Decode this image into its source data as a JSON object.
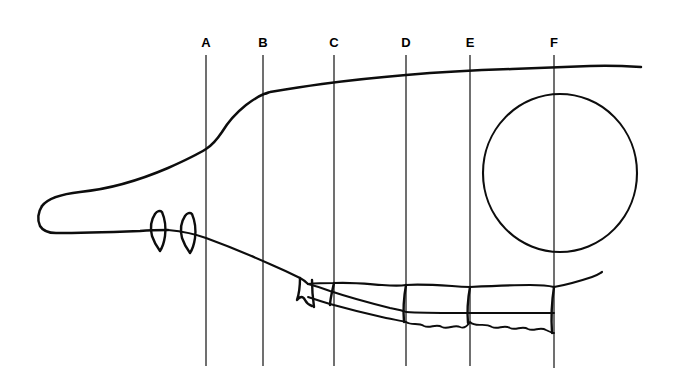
{
  "figure": {
    "background_color": "#ffffff",
    "ink_color": "#0d0d0d",
    "reference_line_color": "#1a1a1a",
    "width": 674,
    "height": 389
  },
  "reference_lines": [
    {
      "label": "A",
      "x": 206,
      "y_top": 55,
      "y_bottom": 366,
      "label_x": 206,
      "label_y": 36
    },
    {
      "label": "B",
      "x": 263,
      "y_top": 55,
      "y_bottom": 366,
      "label_x": 263,
      "label_y": 36
    },
    {
      "label": "C",
      "x": 334,
      "y_top": 55,
      "y_bottom": 366,
      "label_x": 334,
      "label_y": 36
    },
    {
      "label": "D",
      "x": 406,
      "y_top": 55,
      "y_bottom": 366,
      "label_x": 406,
      "label_y": 36
    },
    {
      "label": "E",
      "x": 470,
      "y_top": 55,
      "y_bottom": 366,
      "label_x": 470,
      "label_y": 36
    },
    {
      "label": "F",
      "x": 554,
      "y_top": 55,
      "y_bottom": 368,
      "label_x": 554,
      "label_y": 36
    }
  ],
  "strokes": {
    "dorsal_profile": "M 42 206 C 48 198 62 194 80 192 C 110 189 140 180 168 168 C 186 160 198 154 206 149 C 214 144 218 138 222 132 C 228 122 236 113 246 105 C 254 99 259 96 264 94 C 268 93 269 92 270 92 C 282 90 300 87 322 84 C 352 80 382 77 406 75 C 440 72 480 70 512 69 C 540 68 566 67 590 66 C 610 65 626 66 641 67",
    "rostrum_ventral": "M 42 206 C 38 212 37 220 40 226 C 43 231 49 233 56 233 C 80 233 112 232 140 231 C 152 230 160 230 168 230",
    "toothrow_maxilla": "M 168 230 C 188 232 198 235 206 238 C 228 246 252 256 272 265 C 286 271 294 275 300 278 C 304 280 306 282 308 284",
    "palate_lower": "M 308 284 C 318 283 326 283 334 283 C 352 282 368 284 382 285 C 396 286 400 286 406 285 C 420 284 436 285 452 286 C 462 287 466 287 470 287 C 490 286 512 285 530 285 C 542 285 550 286 554 287",
    "jaw_upper": "M 554 287 C 566 285 580 281 592 277 C 598 275 600 273 602 272",
    "zygomatic_lower": "M 308 284 C 316 286 322 288 330 291 C 348 297 370 303 390 308 C 400 310 404 311 406 312 C 420 313 440 313 460 313 C 468 313 470 313 470 313 C 492 313 520 313 540 313 C 548 313 552 313 554 313",
    "toothrow_occlusal": "M 308 297 C 314 299 320 301 330 304 C 348 309 368 314 386 318 C 396 320 402 321 406 322 C 412 326 418 322 424 326 C 430 329 436 323 442 327 C 448 330 454 324 460 327 C 464 329 468 325 470 322 C 476 328 484 322 492 327 C 498 330 504 324 510 328 C 516 331 522 325 528 329 C 534 332 540 326 546 330 C 550 332 552 333 554 333",
    "cheek_tooth_front": "M 300 278 L 298 300 M 300 278 C 302 284 304 292 306 298 M 306 298 C 308 302 310 304 312 306",
    "premolar_small": "M 300 280 L 297 298 M 304 281 L 303 296 M 308 282 L 309 298",
    "tooth_divider_C": "M 334 283 L 330 305",
    "tooth_divider_D": "M 406 285 L 404 322",
    "tooth_divider_E": "M 470 287 L 468 323",
    "tooth_divider_F": "M 554 287 L 552 333",
    "canine_front_outer": "M 155 214 C 151 220 150 228 152 236 C 153 242 156 247 160 250",
    "canine_front_inner": "M 162 212 C 165 219 166 228 165 236 C 164 243 162 247 160 250",
    "canine_front_cap": "M 155 214 C 157 211 160 210 162 212",
    "canine_rear_outer": "M 185 216 C 181 222 180 230 182 238 C 183 244 186 249 190 252",
    "canine_rear_inner": "M 192 214 C 195 221 196 230 195 238 C 194 245 192 249 190 252",
    "canine_rear_cap": "M 185 216 C 187 213 190 212 192 214"
  },
  "orbit": {
    "name": "orbit-circle",
    "cx": 560,
    "cy": 173,
    "rx": 77,
    "ry": 79
  },
  "legend": {
    "drawing_type": "line-drawing",
    "view": "lateral"
  }
}
